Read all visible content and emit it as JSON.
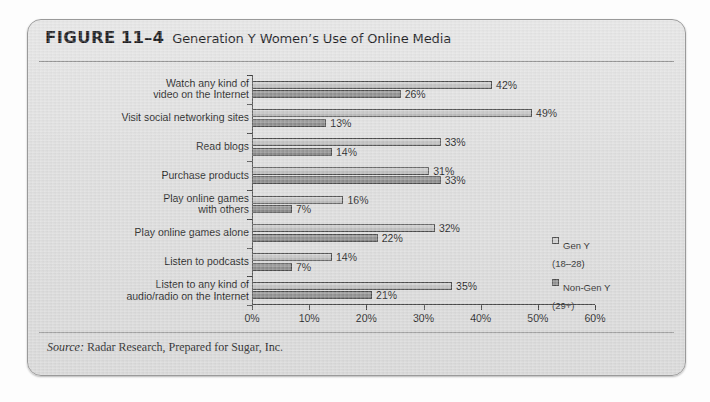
{
  "figure": {
    "label_word": "FIGURE",
    "number": "11–4",
    "title": "Generation Y Women’s Use of Online Media",
    "source_label": "Source:",
    "source_text": " Radar Research, Prepared for Sugar, Inc."
  },
  "legend": {
    "items": [
      {
        "name": "Gen Y",
        "detail": "(18–28)",
        "color": "#cccccc"
      },
      {
        "name": "Non-Gen Y",
        "detail": "(29+)",
        "color": "#8d8d8d"
      }
    ]
  },
  "chart_data": {
    "type": "bar",
    "orientation": "horizontal",
    "title": "Generation Y Women’s Use of Online Media",
    "xlabel": "",
    "ylabel": "",
    "xlim": [
      0,
      60
    ],
    "xticks": [
      0,
      10,
      20,
      30,
      40,
      50,
      60
    ],
    "xtick_labels": [
      "0%",
      "10%",
      "20%",
      "30%",
      "40%",
      "50%",
      "60%"
    ],
    "grid": false,
    "legend_position": "right-inside",
    "value_suffix": "%",
    "categories": [
      "Watch any kind of\nvideo on the Internet",
      "Visit social networking sites",
      "Read blogs",
      "Purchase products",
      "Play online games\nwith others",
      "Play online games alone",
      "Listen to podcasts",
      "Listen to any kind of\naudio/radio on the Internet"
    ],
    "series": [
      {
        "name": "Gen Y (18–28)",
        "color": "#c4c4c4",
        "values": [
          42,
          49,
          33,
          31,
          16,
          32,
          14,
          35
        ],
        "labels": [
          "42%",
          "49%",
          "33%",
          "31%",
          "16%",
          "32%",
          "14%",
          "35%"
        ]
      },
      {
        "name": "Non-Gen Y (29+)",
        "color": "#8a8a8a",
        "values": [
          26,
          13,
          14,
          33,
          7,
          22,
          7,
          21
        ],
        "labels": [
          "26%",
          "13%",
          "14%",
          "33%",
          "7%",
          "22%",
          "7%",
          "21%"
        ]
      }
    ]
  }
}
